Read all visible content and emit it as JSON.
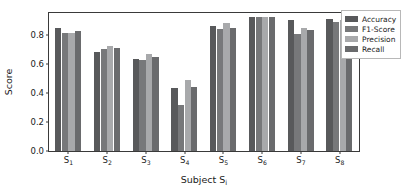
{
  "chart_data": {
    "type": "bar",
    "title": "",
    "xlabel": "Subject S_i",
    "xlabel_main": "Subject S",
    "xlabel_sub": "i",
    "ylabel": "Score",
    "ylim": [
      0.0,
      0.95
    ],
    "yticks": [
      "0.0",
      "0.2",
      "0.4",
      "0.6",
      "0.8"
    ],
    "ytick_values": [
      0.0,
      0.2,
      0.4,
      0.6,
      0.8
    ],
    "grid": false,
    "legend_position": "upper right",
    "categories": [
      "S1",
      "S2",
      "S3",
      "S4",
      "S5",
      "S6",
      "S7",
      "S8"
    ],
    "category_labels_main": [
      "S",
      "S",
      "S",
      "S",
      "S",
      "S",
      "S",
      "S"
    ],
    "category_labels_sub": [
      "1",
      "2",
      "3",
      "4",
      "5",
      "6",
      "7",
      "8"
    ],
    "series": [
      {
        "name": "Accuracy",
        "color": "#58595b",
        "values": [
          0.85,
          0.685,
          0.635,
          0.435,
          0.86,
          0.925,
          0.9,
          0.91
        ]
      },
      {
        "name": "F1-Score",
        "color": "#77787a",
        "values": [
          0.81,
          0.7,
          0.625,
          0.32,
          0.84,
          0.92,
          0.805,
          0.885
        ]
      },
      {
        "name": "Precision",
        "color": "#a8a9ab",
        "values": [
          0.81,
          0.72,
          0.665,
          0.49,
          0.88,
          0.925,
          0.845,
          0.9
        ]
      },
      {
        "name": "Recall",
        "color": "#6a6b6d",
        "values": [
          0.825,
          0.71,
          0.65,
          0.44,
          0.85,
          0.923,
          0.83,
          0.9
        ]
      }
    ]
  },
  "axes": {
    "frame_color": "#3a3a3a",
    "background": "#ffffff"
  }
}
